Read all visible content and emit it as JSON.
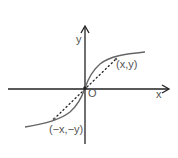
{
  "diagram": {
    "type": "odd-function-graph",
    "axes": {
      "x_label": "x",
      "y_label": "y",
      "origin_label": "O"
    },
    "points": [
      {
        "label": "(x,y)"
      },
      {
        "label": "(−x,−y)"
      }
    ],
    "colors": {
      "axis": "#222222",
      "curve": "#666666",
      "dotted": "#222222",
      "text": "#555555"
    }
  }
}
